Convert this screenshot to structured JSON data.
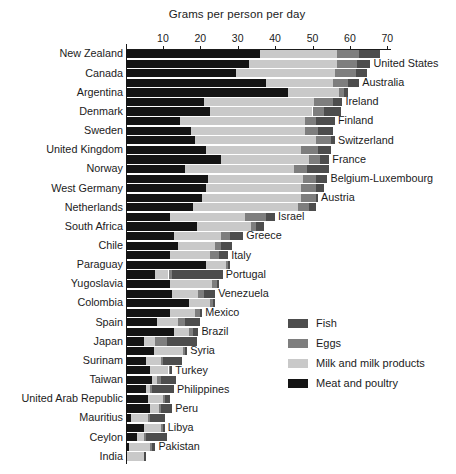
{
  "chart_data": {
    "type": "bar",
    "orientation": "horizontal",
    "stacked": true,
    "title": "Grams per person per day",
    "xlabel": "Grams per person per day",
    "ylabel": "",
    "xlim": [
      0,
      72
    ],
    "grid": false,
    "ticks": [
      10,
      20,
      30,
      40,
      50,
      60,
      70
    ],
    "legend_position": "right-middle",
    "series": [
      {
        "name": "Fish",
        "color": "#4d4d4d"
      },
      {
        "name": "Eggs",
        "color": "#7e7e7e"
      },
      {
        "name": "Milk and milk products",
        "color": "#c9c9c9"
      },
      {
        "name": "Meat and poultry",
        "color": "#141414"
      }
    ],
    "stack_order": [
      "Meat and poultry",
      "Milk and milk products",
      "Eggs",
      "Fish"
    ],
    "categories": [
      "New Zealand",
      "United States",
      "Canada",
      "Australia",
      "Argentina",
      "Ireland",
      "Denmark",
      "Finland",
      "Sweden",
      "Switzerland",
      "United Kingdom",
      "France",
      "Norway",
      "Belgium-Luxembourg",
      "West Germany",
      "Austria",
      "Netherlands",
      "Israel",
      "South Africa",
      "Greece",
      "Chile",
      "Italy",
      "Paraguay",
      "Portugal",
      "Yugoslavia",
      "Venezuela",
      "Colombia",
      "Mexico",
      "Spain",
      "Brazil",
      "Japan",
      "Syria",
      "Surinam",
      "Turkey",
      "Taiwan",
      "Philippines",
      "United Arab Republic",
      "Peru",
      "Mauritius",
      "Libya",
      "Ceylon",
      "Pakistan",
      "India"
    ],
    "label_side": [
      "left",
      "right",
      "left",
      "right",
      "left",
      "right",
      "left",
      "right",
      "left",
      "right",
      "left",
      "right",
      "left",
      "right",
      "left",
      "right",
      "left",
      "right",
      "left",
      "right",
      "left",
      "right",
      "left",
      "right",
      "left",
      "right",
      "left",
      "right",
      "left",
      "right",
      "left",
      "right",
      "left",
      "right",
      "left",
      "right",
      "left",
      "right",
      "left",
      "right",
      "left",
      "right",
      "left"
    ],
    "rows": [
      {
        "category": "New Zealand",
        "meat": 36.0,
        "milk": 20.5,
        "eggs": 6.0,
        "fish": 5.5,
        "total": 68.0
      },
      {
        "category": "United States",
        "meat": 33.0,
        "milk": 23.5,
        "eggs": 5.5,
        "fish": 3.5,
        "total": 65.5
      },
      {
        "category": "Canada",
        "meat": 29.5,
        "milk": 26.5,
        "eggs": 5.5,
        "fish": 3.0,
        "total": 64.5
      },
      {
        "category": "Australia",
        "meat": 37.5,
        "milk": 18.0,
        "eggs": 4.0,
        "fish": 3.0,
        "total": 62.5
      },
      {
        "category": "Argentina",
        "meat": 43.5,
        "milk": 13.5,
        "eggs": 1.5,
        "fish": 1.0,
        "total": 59.5
      },
      {
        "category": "Ireland",
        "meat": 21.0,
        "milk": 29.5,
        "eggs": 5.0,
        "fish": 2.5,
        "total": 58.0
      },
      {
        "category": "Denmark",
        "meat": 22.5,
        "milk": 27.5,
        "eggs": 3.0,
        "fish": 4.5,
        "total": 57.5
      },
      {
        "category": "Finland",
        "meat": 14.5,
        "milk": 33.5,
        "eggs": 3.0,
        "fish": 5.0,
        "total": 56.0
      },
      {
        "category": "Sweden",
        "meat": 17.5,
        "milk": 30.5,
        "eggs": 3.5,
        "fish": 4.0,
        "total": 55.5
      },
      {
        "category": "Switzerland",
        "meat": 18.5,
        "milk": 32.5,
        "eggs": 4.0,
        "fish": 1.0,
        "total": 56.0
      },
      {
        "category": "United Kingdom",
        "meat": 21.5,
        "milk": 25.5,
        "eggs": 4.5,
        "fish": 3.5,
        "total": 55.0
      },
      {
        "category": "France",
        "meat": 25.5,
        "milk": 23.5,
        "eggs": 3.0,
        "fish": 2.5,
        "total": 54.5
      },
      {
        "category": "Norway",
        "meat": 16.0,
        "milk": 29.0,
        "eggs": 3.5,
        "fish": 6.0,
        "total": 54.5
      },
      {
        "category": "Belgium-Luxembourg",
        "meat": 22.0,
        "milk": 25.5,
        "eggs": 3.5,
        "fish": 3.0,
        "total": 54.0
      },
      {
        "category": "West Germany",
        "meat": 21.5,
        "milk": 25.5,
        "eggs": 4.0,
        "fish": 2.0,
        "total": 53.0
      },
      {
        "category": "Austria",
        "meat": 20.5,
        "milk": 26.5,
        "eggs": 4.0,
        "fish": 0.5,
        "total": 51.5
      },
      {
        "category": "Netherlands",
        "meat": 18.0,
        "milk": 28.0,
        "eggs": 3.0,
        "fish": 2.0,
        "total": 51.0
      },
      {
        "category": "Israel",
        "meat": 12.0,
        "milk": 20.0,
        "eggs": 5.5,
        "fish": 2.5,
        "total": 40.0
      },
      {
        "category": "South Africa",
        "meat": 19.0,
        "milk": 14.5,
        "eggs": 1.5,
        "fish": 2.0,
        "total": 37.0
      },
      {
        "category": "Greece",
        "meat": 13.0,
        "milk": 12.5,
        "eggs": 2.5,
        "fish": 3.5,
        "total": 31.5
      },
      {
        "category": "Chile",
        "meat": 14.0,
        "milk": 10.0,
        "eggs": 1.5,
        "fish": 3.0,
        "total": 28.5
      },
      {
        "category": "Italy",
        "meat": 12.0,
        "milk": 10.5,
        "eggs": 2.5,
        "fish": 2.5,
        "total": 27.5
      },
      {
        "category": "Paraguay",
        "meat": 21.5,
        "milk": 5.5,
        "eggs": 0.5,
        "fish": 0.5,
        "total": 28.0
      },
      {
        "category": "Portugal",
        "meat": 8.0,
        "milk": 3.5,
        "eggs": 1.0,
        "fish": 13.5,
        "total": 26.0
      },
      {
        "category": "Yugoslavia",
        "meat": 12.0,
        "milk": 11.0,
        "eggs": 1.5,
        "fish": 0.5,
        "total": 25.0
      },
      {
        "category": "Venezuela",
        "meat": 12.5,
        "milk": 7.0,
        "eggs": 1.5,
        "fish": 3.0,
        "total": 24.0
      },
      {
        "category": "Colombia",
        "meat": 17.0,
        "milk": 5.5,
        "eggs": 1.0,
        "fish": 0.5,
        "total": 24.0
      },
      {
        "category": "Mexico",
        "meat": 12.0,
        "milk": 6.5,
        "eggs": 1.5,
        "fish": 0.5,
        "total": 20.5
      },
      {
        "category": "Spain",
        "meat": 8.5,
        "milk": 5.5,
        "eggs": 2.0,
        "fish": 4.0,
        "total": 20.0
      },
      {
        "category": "Brazil",
        "meat": 13.0,
        "milk": 4.0,
        "eggs": 1.0,
        "fish": 1.5,
        "total": 19.5
      },
      {
        "category": "Japan",
        "meat": 5.0,
        "milk": 3.0,
        "eggs": 3.0,
        "fish": 8.0,
        "total": 19.0
      },
      {
        "category": "Syria",
        "meat": 7.5,
        "milk": 8.0,
        "eggs": 0.5,
        "fish": 0.5,
        "total": 16.5
      },
      {
        "category": "Surinam",
        "meat": 5.5,
        "milk": 4.0,
        "eggs": 0.5,
        "fish": 5.0,
        "total": 15.0
      },
      {
        "category": "Turkey",
        "meat": 6.5,
        "milk": 5.0,
        "eggs": 0.5,
        "fish": 0.5,
        "total": 12.5
      },
      {
        "category": "Taiwan",
        "meat": 7.0,
        "milk": 1.5,
        "eggs": 1.0,
        "fish": 4.0,
        "total": 13.5
      },
      {
        "category": "Philippines",
        "meat": 5.5,
        "milk": 1.0,
        "eggs": 0.5,
        "fish": 6.0,
        "total": 13.0
      },
      {
        "category": "United Arab Republic",
        "meat": 6.0,
        "milk": 4.0,
        "eggs": 0.5,
        "fish": 1.5,
        "total": 12.0
      },
      {
        "category": "Peru",
        "meat": 6.5,
        "milk": 2.5,
        "eggs": 0.5,
        "fish": 3.0,
        "total": 12.5
      },
      {
        "category": "Mauritius",
        "meat": 1.5,
        "milk": 4.5,
        "eggs": 0.5,
        "fish": 4.0,
        "total": 10.5
      },
      {
        "category": "Libya",
        "meat": 5.0,
        "milk": 4.5,
        "eggs": 0.5,
        "fish": 0.5,
        "total": 10.5
      },
      {
        "category": "Ceylon",
        "meat": 3.0,
        "milk": 2.0,
        "eggs": 0.5,
        "fish": 5.5,
        "total": 11.0
      },
      {
        "category": "Pakistan",
        "meat": 1.0,
        "milk": 5.5,
        "eggs": 0.5,
        "fish": 1.0,
        "total": 8.0
      },
      {
        "category": "India",
        "meat": 0.5,
        "milk": 4.5,
        "eggs": 0.0,
        "fish": 0.5,
        "total": 5.5
      }
    ]
  },
  "legend": {
    "items": [
      {
        "label": "Fish",
        "color": "#4d4d4d"
      },
      {
        "label": "Eggs",
        "color": "#7e7e7e"
      },
      {
        "label": "Milk and milk products",
        "color": "#c9c9c9"
      },
      {
        "label": "Meat and poultry",
        "color": "#141414"
      }
    ]
  }
}
